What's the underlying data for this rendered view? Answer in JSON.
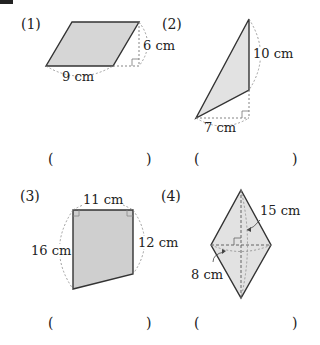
{
  "problems": [
    {
      "number": "(1)",
      "shape": "parallelogram",
      "measurements": {
        "base": "9 cm",
        "height": "6 cm"
      },
      "answer": {
        "open": "(",
        "close": ")"
      }
    },
    {
      "number": "(2)",
      "shape": "triangle",
      "measurements": {
        "base": "7 cm",
        "height": "10 cm"
      },
      "answer": {
        "open": "(",
        "close": ")"
      }
    },
    {
      "number": "(3)",
      "shape": "trapezoid",
      "measurements": {
        "top": "11 cm",
        "left": "16 cm",
        "right": "12 cm"
      },
      "answer": {
        "open": "(",
        "close": ")"
      }
    },
    {
      "number": "(4)",
      "shape": "rhombus",
      "measurements": {
        "long_diagonal": "15 cm",
        "short_diagonal": "8 cm"
      },
      "answer": {
        "open": "(",
        "close": ")"
      }
    }
  ],
  "colors": {
    "fill": "#d9d9d9",
    "stroke": "#333333",
    "dash": "#777777"
  }
}
